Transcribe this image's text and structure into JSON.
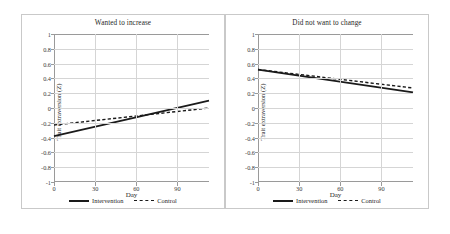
{
  "figure": {
    "axis_label_y": "Trait extraversion (Z)",
    "axis_label_x": "Day",
    "legend": [
      {
        "label": "Intervention",
        "style": "solid",
        "color": "#1a1a1a"
      },
      {
        "label": "Control",
        "style": "dashed",
        "color": "#1a1a1a"
      }
    ],
    "y_ticks": [
      "1",
      "0.8",
      "0.6",
      "0.4",
      "0.2",
      "0",
      "-0.2",
      "-0.4",
      "-0.6",
      "-0.8",
      "-1"
    ],
    "x_ticks": [
      "0",
      "30",
      "60",
      "90"
    ]
  },
  "chart_data": [
    {
      "type": "line",
      "title": "Wanted to increase",
      "xlabel": "Day",
      "ylabel": "Trait extraversion (Z)",
      "xlim": [
        0,
        113
      ],
      "ylim": [
        -1,
        1
      ],
      "ytick_values": [
        1,
        0.8,
        0.6,
        0.4,
        0.2,
        0,
        -0.2,
        -0.4,
        -0.6,
        -0.8,
        -1
      ],
      "xtick_values": [
        0,
        30,
        60,
        90
      ],
      "grid": "horizontal-and-vertical",
      "legend_position": "bottom-center",
      "series": [
        {
          "name": "Intervention",
          "style": "solid",
          "x": [
            0,
            113
          ],
          "values": [
            -0.38,
            0.1
          ]
        },
        {
          "name": "Control",
          "style": "dashed",
          "x": [
            0,
            113
          ],
          "values": [
            -0.23,
            0.0
          ]
        }
      ]
    },
    {
      "type": "line",
      "title": "Did not want to change",
      "xlabel": "Day",
      "ylabel": "Trait extraversion (Z)",
      "xlim": [
        0,
        113
      ],
      "ylim": [
        -1,
        1
      ],
      "ytick_values": [
        1,
        0.8,
        0.6,
        0.4,
        0.2,
        0,
        -0.2,
        -0.4,
        -0.6,
        -0.8,
        -1
      ],
      "xtick_values": [
        0,
        30,
        60,
        90
      ],
      "grid": "horizontal-and-vertical",
      "legend_position": "bottom-center",
      "series": [
        {
          "name": "Intervention",
          "style": "solid",
          "x": [
            0,
            113
          ],
          "values": [
            0.52,
            0.21
          ]
        },
        {
          "name": "Control",
          "style": "dashed",
          "x": [
            0,
            113
          ],
          "values": [
            0.52,
            0.27
          ]
        }
      ]
    }
  ]
}
